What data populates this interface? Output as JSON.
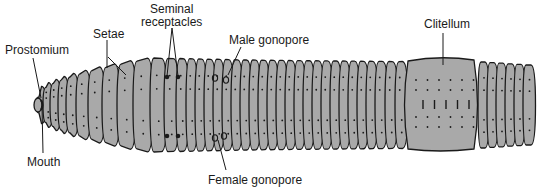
{
  "diagram": {
    "body_color": "#a9a9a9",
    "outline_color": "#1a1a1a",
    "labels": {
      "prostomium": "Prostomium",
      "setae": "Setae",
      "seminal_line1": "Seminal",
      "seminal_line2": "receptacles",
      "male_gonopore": "Male gonopore",
      "clitellum": "Clitellum",
      "mouth": "Mouth",
      "female_gonopore": "Female gonopore"
    }
  }
}
